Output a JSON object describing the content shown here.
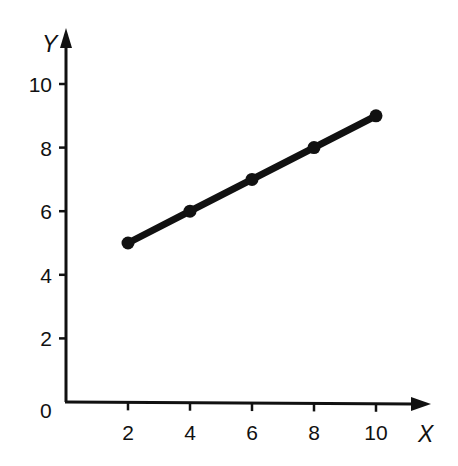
{
  "chart_data": {
    "type": "line",
    "title": "",
    "xlabel": "X",
    "ylabel": "Y",
    "x": [
      2,
      4,
      6,
      8,
      10
    ],
    "series": [
      {
        "name": "",
        "values": [
          5,
          6,
          7,
          8,
          9
        ]
      }
    ],
    "xlim": [
      0,
      11.5
    ],
    "ylim": [
      0,
      11.5
    ],
    "xticks": [
      2,
      4,
      6,
      8,
      10
    ],
    "yticks": [
      2,
      4,
      6,
      8,
      10
    ],
    "origin_label": "0",
    "grid": false,
    "legend": null,
    "markers": true
  },
  "style": {
    "line_color": "#111111",
    "axis_color": "#111111",
    "background": "#ffffff"
  }
}
